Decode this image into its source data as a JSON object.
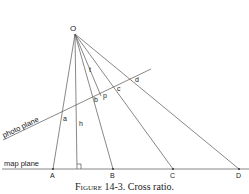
{
  "diagram": {
    "apex_label": "O",
    "height_label": "h",
    "t_label": "t",
    "photo_plane_label": "photo plane",
    "map_plane_label": "map plane",
    "photo_points": [
      "a",
      "b",
      "p",
      "c",
      "d"
    ],
    "map_points": [
      "A",
      "B",
      "C",
      "D"
    ]
  },
  "caption": {
    "figure": "Figure 14-3.",
    "text": "Cross ratio."
  }
}
